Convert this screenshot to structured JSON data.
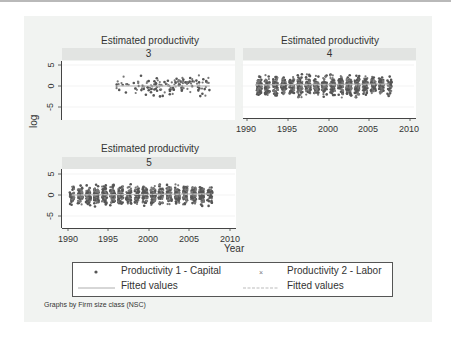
{
  "chart_data": {
    "type": "scatter",
    "layout": "facet-by-group (3 panels)",
    "panel_title": "Estimated productivity",
    "ylabel": "log",
    "xlabel": "Year",
    "x_ticks": [
      1990,
      1995,
      2000,
      2005,
      2010
    ],
    "y_ticks": [
      5,
      0,
      -5
    ],
    "xlim": [
      1990,
      2010
    ],
    "ylim": [
      -7.5,
      6
    ],
    "grid": true,
    "panels": [
      {
        "label": "3",
        "x_range": [
          1996,
          2007.5
        ],
        "y_range": [
          -5,
          5
        ],
        "density": "sparse",
        "fitted_capital": [
          0,
          0
        ],
        "fitted_labor": [
          0,
          0
        ]
      },
      {
        "label": "4",
        "x_range": [
          1991,
          2007.5
        ],
        "y_range": [
          -7,
          4.5
        ],
        "density": "dense",
        "fitted_capital": [
          0.3,
          0.5
        ],
        "fitted_labor": [
          0.2,
          0.3
        ]
      },
      {
        "label": "5",
        "x_range": [
          1990.5,
          2007.5
        ],
        "y_range": [
          -6,
          5
        ],
        "density": "dense",
        "fitted_capital": [
          0,
          0.3
        ],
        "fitted_labor": [
          0,
          0.2
        ]
      }
    ],
    "series": [
      {
        "name": "Productivity 1 - Capital",
        "marker": "dot"
      },
      {
        "name": "Productivity 2 - Labor",
        "marker": "x"
      },
      {
        "name": "Fitted values",
        "style": "solid line"
      },
      {
        "name": "Fitted values",
        "style": "dashed line"
      }
    ],
    "legend_position": "bottom"
  },
  "legend": {
    "item1": "Productivity 1 - Capital",
    "item2": "Productivity 2 - Labor",
    "item3": "Fitted values",
    "item4": "Fitted values"
  },
  "labels": {
    "title3": "Estimated productivity",
    "title4": "Estimated productivity",
    "title5": "Estimated productivity",
    "strip3": "3",
    "strip4": "4",
    "strip5": "5",
    "ylabel": "log",
    "xlabel": "Year",
    "note": "Graphs by Firm size class (NSC)",
    "yt_5": "5",
    "yt_0": "0",
    "yt_m5": "-5",
    "x1990": "1990",
    "x1995": "1995",
    "x2000": "2000",
    "x2005": "2005",
    "x2010": "2010"
  },
  "colors": {
    "marker": "#555555",
    "fitted": "#aaaaaa",
    "outer_bg": "#f1f3f1",
    "strip_bg": "#e2e4e2"
  }
}
